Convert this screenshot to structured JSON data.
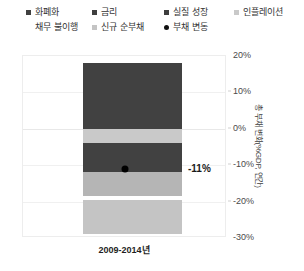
{
  "legend": {
    "items": [
      {
        "label": "화폐화",
        "marker": "square",
        "color": "#404040",
        "row": 0,
        "col": 0
      },
      {
        "label": "금리",
        "marker": "square",
        "color": "#3f3f3f",
        "row": 0,
        "col": 1
      },
      {
        "label": "실질 성장",
        "marker": "square",
        "color": "#3d3d3d",
        "row": 0,
        "col": 2
      },
      {
        "label": "인플레이션",
        "marker": "square",
        "color": "#c9c9c9",
        "row": 0,
        "col": 3
      },
      {
        "label": "채무 불이행",
        "marker": "none",
        "color": "#cfcfcf",
        "row": 1,
        "col": 0
      },
      {
        "label": "신규 순부채",
        "marker": "square",
        "color": "#c4c4c4",
        "row": 1,
        "col": 1
      },
      {
        "label": "부채 변동",
        "marker": "dot",
        "color": "#111111",
        "row": 1,
        "col": 2
      }
    ]
  },
  "axes": {
    "y_ticks": [
      "20%",
      "10%",
      "0%",
      "-10%",
      "-20%",
      "-30%"
    ],
    "y_title": "총 부채 변화(%GDP, 연간)",
    "x_label": "2009-2014년"
  },
  "annotation": {
    "value_label": "-11%"
  },
  "colors": {
    "dark": "#414141",
    "mid_gray": "#b5b5b5",
    "light_gray": "#c9c9c9",
    "pale_gray": "#c4c4c4",
    "dot": "#000000",
    "grid": "#f0f0f0",
    "frame": "#ededed"
  },
  "chart_data": {
    "type": "bar",
    "title": "",
    "subtitle": "",
    "xlabel": "2009-2014년",
    "ylabel": "총 부채 변화(%GDP, 연간)",
    "ylim": [
      -30,
      20
    ],
    "ytick_values": [
      20,
      10,
      0,
      -10,
      -20,
      -30
    ],
    "ytick_labels": [
      "20%",
      "10%",
      "0%",
      "-10%",
      "-20%",
      "-30%"
    ],
    "categories": [
      "2009-2014년"
    ],
    "grid": true,
    "legend_position": "top",
    "stacked": true,
    "series": [
      {
        "name": "화폐화",
        "values": [
          18.0
        ],
        "color": "#414141",
        "y_from": 18.0,
        "y_to": 0.0
      },
      {
        "name": "인플레이션",
        "values": [
          -4.0
        ],
        "color": "#c9c9c9",
        "y_from": 0.0,
        "y_to": -4.0
      },
      {
        "name": "실질 성장",
        "values": [
          -8.0
        ],
        "color": "#414141",
        "y_from": -4.0,
        "y_to": -12.0
      },
      {
        "name": "신규 순부채",
        "values": [
          -6.5
        ],
        "color": "#b5b5b5",
        "y_from": -12.0,
        "y_to": -18.5
      },
      {
        "name": "채무 불이행",
        "values": [
          -9.5
        ],
        "color": "#c4c4c4",
        "y_from": -19.5,
        "y_to": -29.0
      }
    ],
    "markers": [
      {
        "name": "부채 변동",
        "x": "2009-2014년",
        "y": -11.0,
        "label": "-11%",
        "color": "#000000"
      }
    ]
  }
}
